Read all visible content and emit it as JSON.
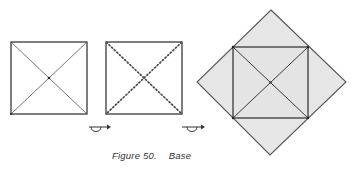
{
  "figure": {
    "number_label": "Figure 50.",
    "title": "Base"
  },
  "steps": [
    {
      "name": "step-1-square-creased-diagonals",
      "fold_type": "valley"
    },
    {
      "name": "step-2-square-mountain-diagonals",
      "fold_type": "mountain"
    },
    {
      "name": "step-3-base-result",
      "fold_type": "result"
    }
  ],
  "symbols": [
    {
      "name": "turn-over-symbol",
      "between": "step-1 and step-2"
    },
    {
      "name": "turn-over-symbol",
      "between": "step-2 and step-3"
    }
  ],
  "colors": {
    "line": "#3a3a3a",
    "paper_fill": "#e6e6e6",
    "background": "#ffffff"
  }
}
